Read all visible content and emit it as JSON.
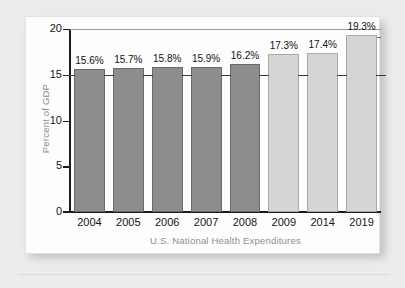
{
  "chart_data": {
    "type": "bar",
    "title": "",
    "xlabel": "U.S. National Health Expenditures",
    "ylabel": "Percent of GDP",
    "categories": [
      "2004",
      "2005",
      "2006",
      "2007",
      "2008",
      "2009",
      "2014",
      "2019"
    ],
    "values": [
      15.6,
      15.7,
      15.8,
      15.9,
      16.2,
      17.3,
      17.4,
      19.3
    ],
    "value_labels": [
      "15.6%",
      "15.7%",
      "15.8%",
      "15.9%",
      "16.2%",
      "17.3%",
      "17.4%",
      "19.3%"
    ],
    "bar_styles": [
      "dark",
      "dark",
      "dark",
      "dark",
      "dark",
      "light",
      "light",
      "light"
    ],
    "ylim": [
      0,
      20
    ],
    "y_ticks": [
      20,
      15,
      10,
      5,
      0
    ],
    "y_tick_labels": [
      "20",
      "15",
      "10",
      "5",
      "0"
    ],
    "grid": "horizontal-partial",
    "legend": "none",
    "colors": {
      "bar_dark": "#8d8d8d",
      "bar_light": "#d5d5d3",
      "axis": "#1b1b1b",
      "axis_title": "#8d8d8d",
      "tick_label": "#141414",
      "card_background": "#fdfdfd",
      "page_background": "#ececeb"
    }
  }
}
